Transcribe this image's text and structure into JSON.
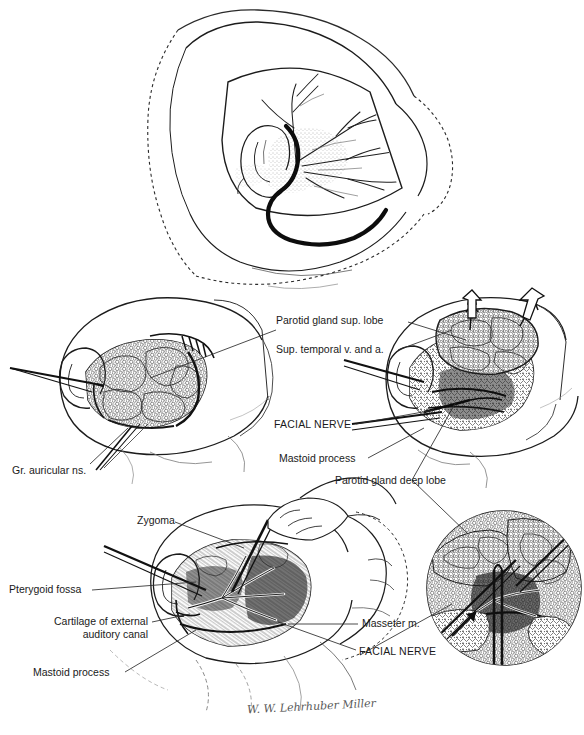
{
  "plate": {
    "title": "Parotidectomy surgical technique plate",
    "background_color": "#ffffff",
    "ink_color": "#1a1a1a",
    "width": 584,
    "height": 735
  },
  "panels": [
    {
      "id": "panel-top",
      "name": "head-incision-overview",
      "caption": ""
    },
    {
      "id": "panel-middle-left",
      "name": "skin-flap-elevated",
      "caption": ""
    },
    {
      "id": "panel-middle-right",
      "name": "superficial-lobe-retracted",
      "caption": ""
    },
    {
      "id": "panel-bottom-left",
      "name": "deep-lobe-dissection",
      "caption": ""
    },
    {
      "id": "panel-bottom-right",
      "name": "facial-nerve-closeup-inset",
      "caption": ""
    }
  ],
  "labels": {
    "parotid_gland_sup_lobe": "Parotid gland sup. lobe",
    "sup_temporal_v_and_a": "Sup. temporal v. and a.",
    "facial_nerve_mid": "FACIAL NERVE",
    "mastoid_process_mid": "Mastoid process",
    "parotid_gland_deep_lobe": "Parotid gland deep lobe",
    "gr_auricular_ns": "Gr. auricular ns.",
    "zygoma": "Zygoma",
    "pterygoid_fossa": "Pterygoid fossa",
    "cartilage_of_external_line1": "Cartilage of external",
    "cartilage_of_external_line2": "auditory canal",
    "mastoid_process_bottom": "Mastoid process",
    "masseter_m": "Masseter m.",
    "facial_nerve_bottom": "FACIAL NERVE"
  },
  "signature": {
    "text": "W. W. Lehrhuber Miller",
    "legible": false
  }
}
